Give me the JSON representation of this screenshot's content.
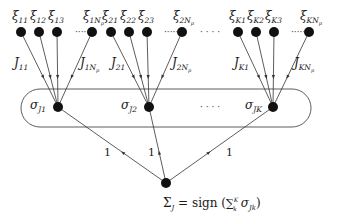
{
  "diagram": {
    "type": "committee-machine-network",
    "colors": {
      "node": "#111111",
      "edge": "#333333",
      "background": "#ffffff"
    },
    "input_nodes": [
      {
        "id": "x11",
        "label": "ξ",
        "sub": "11",
        "x": 21,
        "y": 32
      },
      {
        "id": "x12",
        "label": "ξ",
        "sub": "12",
        "x": 39,
        "y": 32
      },
      {
        "id": "x13",
        "label": "ξ",
        "sub": "13",
        "x": 57,
        "y": 32
      },
      {
        "id": "x1Np",
        "label": "ξ",
        "sub": "1Np",
        "x": 92,
        "y": 32
      },
      {
        "id": "x21",
        "label": "ξ",
        "sub": "21",
        "x": 111,
        "y": 32
      },
      {
        "id": "x22",
        "label": "ξ",
        "sub": "22",
        "x": 129,
        "y": 32
      },
      {
        "id": "x23",
        "label": "ξ",
        "sub": "23",
        "x": 147,
        "y": 32
      },
      {
        "id": "x2Np",
        "label": "ξ",
        "sub": "2Np",
        "x": 182,
        "y": 32
      },
      {
        "id": "xK1",
        "label": "ξ",
        "sub": "K1",
        "x": 238,
        "y": 32
      },
      {
        "id": "xK2",
        "label": "ξ",
        "sub": "K2",
        "x": 256,
        "y": 32
      },
      {
        "id": "xK3",
        "label": "ξ",
        "sub": "K3",
        "x": 274,
        "y": 32
      },
      {
        "id": "xKNp",
        "label": "ξ",
        "sub": "KNp",
        "x": 309,
        "y": 32
      }
    ],
    "hidden_nodes": [
      {
        "id": "s1",
        "label": "σ",
        "sub": "J1",
        "x": 58,
        "y": 107
      },
      {
        "id": "s2",
        "label": "σ",
        "sub": "J2",
        "x": 149,
        "y": 107
      },
      {
        "id": "sK",
        "label": "σ",
        "sub": "JK",
        "x": 273,
        "y": 107
      }
    ],
    "output_node": {
      "id": "out",
      "x": 166,
      "y": 183,
      "label": "Σ",
      "sub": "J",
      "formula_text": "= sign",
      "formula_sum": "∑",
      "sum_sup": "K",
      "sum_sub": "k",
      "formula_term": "σ",
      "term_sub": "Jk"
    },
    "weight_labels": [
      {
        "text": "J",
        "sub": "11",
        "x": 14,
        "y": 67
      },
      {
        "text": "J",
        "sub": "1Np",
        "x": 80,
        "y": 67
      },
      {
        "text": "J",
        "sub": "21",
        "x": 111,
        "y": 67
      },
      {
        "text": "J",
        "sub": "2Np",
        "x": 172,
        "y": 67
      },
      {
        "text": "J",
        "sub": "K1",
        "x": 234,
        "y": 67
      },
      {
        "text": "J",
        "sub": "KNp",
        "x": 294,
        "y": 67
      }
    ],
    "output_weights": [
      {
        "text": "1",
        "x": 104,
        "y": 156
      },
      {
        "text": "1",
        "x": 148,
        "y": 156
      },
      {
        "text": "1",
        "x": 226,
        "y": 156
      }
    ],
    "ellipses": [
      {
        "text": "·····",
        "x": 75,
        "y": 35
      },
      {
        "text": "·····",
        "x": 164,
        "y": 35
      },
      {
        "text": "· · · ·",
        "x": 200,
        "y": 35
      },
      {
        "text": "·····",
        "x": 291,
        "y": 35
      },
      {
        "text": "· · · ·",
        "x": 200,
        "y": 110
      }
    ],
    "committee_box": {
      "x": 21,
      "y": 89,
      "width": 290,
      "height": 38,
      "rx": 19
    }
  }
}
